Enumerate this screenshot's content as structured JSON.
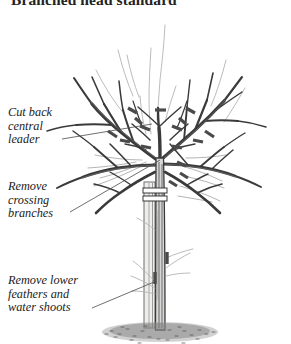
{
  "figure": {
    "title": "Branched head standard",
    "background_color": "#ffffff",
    "width": 291,
    "height": 344
  },
  "callouts": [
    {
      "id": "cut-back-central-leader",
      "text": "Cut back\ncentral\nleader",
      "lines": [
        "Cut back",
        "central",
        "leader"
      ],
      "points_to": "central leader at top of crown"
    },
    {
      "id": "remove-crossing-branches",
      "text": "Remove\ncrossing\nbranches",
      "lines": [
        "Remove",
        "crossing",
        "branches"
      ],
      "points_to": "crossing branches in mid crown"
    },
    {
      "id": "remove-lower-feathers-and-water-shoots",
      "text": "Remove lower\nfeathers and\nwater shoots",
      "lines": [
        "Remove lower",
        "feathers and",
        "water shoots"
      ],
      "points_to": "lower trunk feathers and water shoots"
    }
  ],
  "colors": {
    "ink_dark": "#2e2e2e",
    "ink_mid": "#595959",
    "ink_light": "#aeaeae",
    "remove_gray": "#b9b9b9",
    "stake_fill": "#e8e8e6",
    "stake_edge": "#6e6e6e",
    "ground": "#8c8c8c",
    "leader_line": "#4a4a4a",
    "text": "#1b1b1b",
    "title": "#232323"
  },
  "elements": {
    "tree_crown_label": "bare branched crown",
    "trunk_label": "tree trunk",
    "stake_label": "support stake",
    "tie_label": "stake tie",
    "ground_label": "stippled ground",
    "cut_mark_label": "pruning cut mark",
    "remove_branch_label": "branch to remove",
    "water_shoot_label": "water shoot"
  }
}
